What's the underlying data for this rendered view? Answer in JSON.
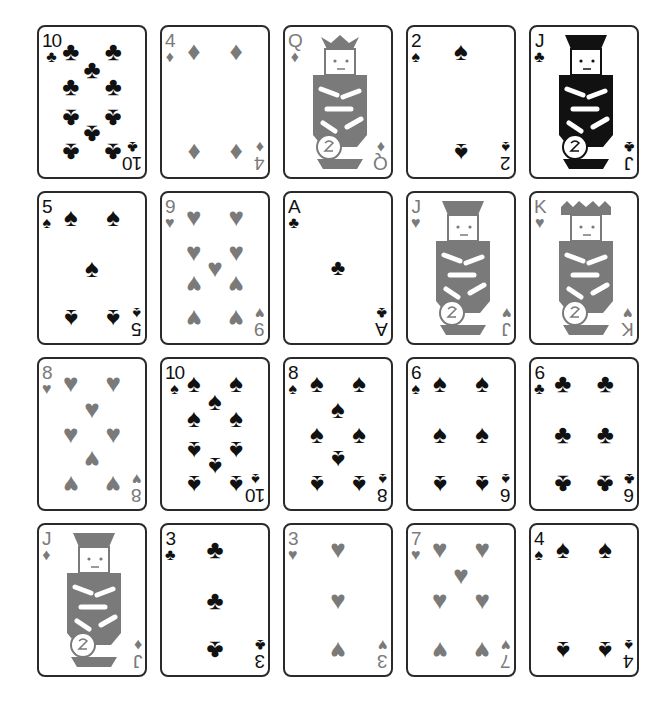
{
  "colors": {
    "red_suit": "#7a7a7a",
    "black_suit": "#111111",
    "border": "#2a2a2a"
  },
  "suits": {
    "clubs": "♣",
    "diamonds": "♦",
    "hearts": "♥",
    "spades": "♠"
  },
  "cards": [
    {
      "rank": "10",
      "suit": "♣",
      "suit_name": "clubs",
      "color": "black"
    },
    {
      "rank": "4",
      "suit": "♦",
      "suit_name": "diamonds",
      "color": "red"
    },
    {
      "rank": "Q",
      "suit": "♦",
      "suit_name": "diamonds",
      "color": "red"
    },
    {
      "rank": "2",
      "suit": "♠",
      "suit_name": "spades",
      "color": "black"
    },
    {
      "rank": "J",
      "suit": "♣",
      "suit_name": "clubs",
      "color": "black"
    },
    {
      "rank": "5",
      "suit": "♠",
      "suit_name": "spades",
      "color": "black"
    },
    {
      "rank": "9",
      "suit": "♥",
      "suit_name": "hearts",
      "color": "red"
    },
    {
      "rank": "A",
      "suit": "♣",
      "suit_name": "clubs",
      "color": "black"
    },
    {
      "rank": "J",
      "suit": "♥",
      "suit_name": "hearts",
      "color": "red"
    },
    {
      "rank": "K",
      "suit": "♥",
      "suit_name": "hearts",
      "color": "red"
    },
    {
      "rank": "8",
      "suit": "♥",
      "suit_name": "hearts",
      "color": "red"
    },
    {
      "rank": "10",
      "suit": "♠",
      "suit_name": "spades",
      "color": "black"
    },
    {
      "rank": "8",
      "suit": "♠",
      "suit_name": "spades",
      "color": "black"
    },
    {
      "rank": "6",
      "suit": "♠",
      "suit_name": "spades",
      "color": "black"
    },
    {
      "rank": "6",
      "suit": "♣",
      "suit_name": "clubs",
      "color": "black"
    },
    {
      "rank": "J",
      "suit": "♦",
      "suit_name": "diamonds",
      "color": "red"
    },
    {
      "rank": "3",
      "suit": "♣",
      "suit_name": "clubs",
      "color": "black"
    },
    {
      "rank": "3",
      "suit": "♥",
      "suit_name": "hearts",
      "color": "red"
    },
    {
      "rank": "7",
      "suit": "♥",
      "suit_name": "hearts",
      "color": "red"
    },
    {
      "rank": "4",
      "suit": "♠",
      "suit_name": "spades",
      "color": "black"
    }
  ]
}
